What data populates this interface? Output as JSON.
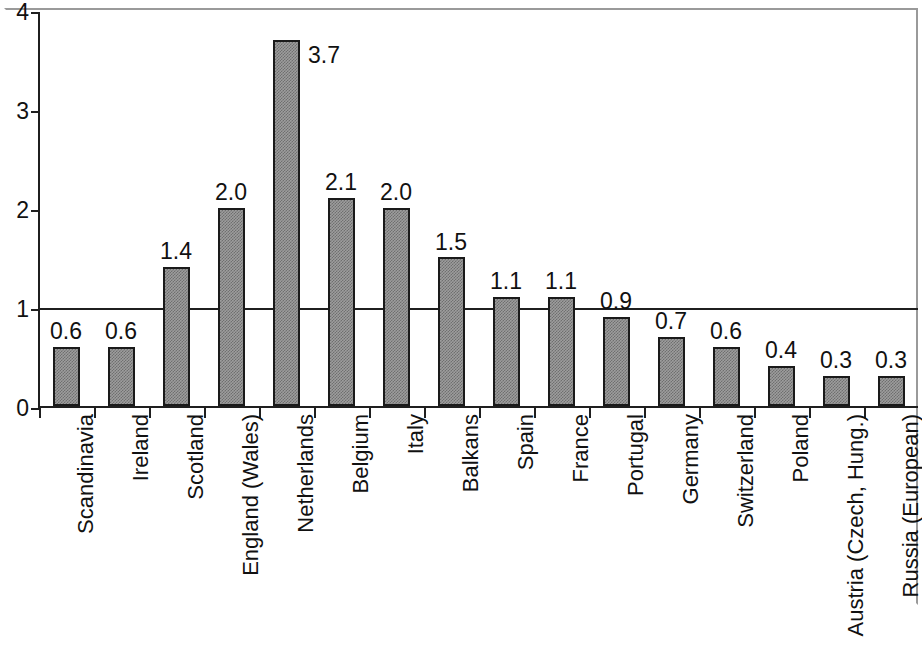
{
  "chart_data": {
    "type": "bar",
    "title": "",
    "subtitle": "",
    "xlabel": "",
    "ylabel": "",
    "ylim": [
      0,
      4
    ],
    "y_ticks": [
      "0",
      "1",
      "2",
      "3",
      "4"
    ],
    "y_tick_values": [
      0,
      1,
      2,
      3,
      4
    ],
    "grid": false,
    "legend": "none",
    "reference_line": 1,
    "bar_color": "#9d9d9d",
    "bar_edge_color": "#1a1a1a",
    "axis_color": "#1f1f1f",
    "categories": [
      "Scandinavia",
      "Ireland",
      "Scotland",
      "England (Wales)",
      "Netherlands",
      "Belgium",
      "Italy",
      "Balkans",
      "Spain",
      "France",
      "Portugal",
      "Germany",
      "Switzerland",
      "Poland",
      "Austria (Czech, Hung.)",
      "Russia (European)"
    ],
    "values": [
      0.6,
      0.6,
      1.4,
      2.0,
      3.7,
      2.1,
      2.0,
      1.5,
      1.1,
      1.1,
      0.9,
      0.7,
      0.6,
      0.4,
      0.3,
      0.3
    ],
    "value_labels": [
      "0.6",
      "0.6",
      "1.4",
      "2.0",
      "3.7",
      "2.1",
      "2.0",
      "1.5",
      "1.1",
      "1.1",
      "0.9",
      "0.7",
      "0.6",
      "0.4",
      "0.3",
      "0.3"
    ],
    "label_placement": [
      "above",
      "above",
      "above",
      "above",
      "right",
      "above",
      "above",
      "above",
      "above",
      "above",
      "above",
      "above",
      "above",
      "above",
      "above",
      "above"
    ]
  }
}
